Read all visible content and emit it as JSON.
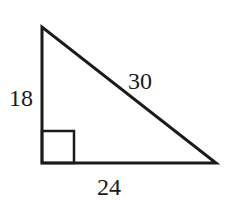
{
  "diagram": {
    "type": "right-triangle",
    "right_angle_vertex": "bottom-left",
    "labels": {
      "vertical_leg": "18",
      "hypotenuse": "30",
      "horizontal_leg": "24"
    },
    "stroke_color": "#1a1a1a",
    "background": "#ffffff"
  }
}
